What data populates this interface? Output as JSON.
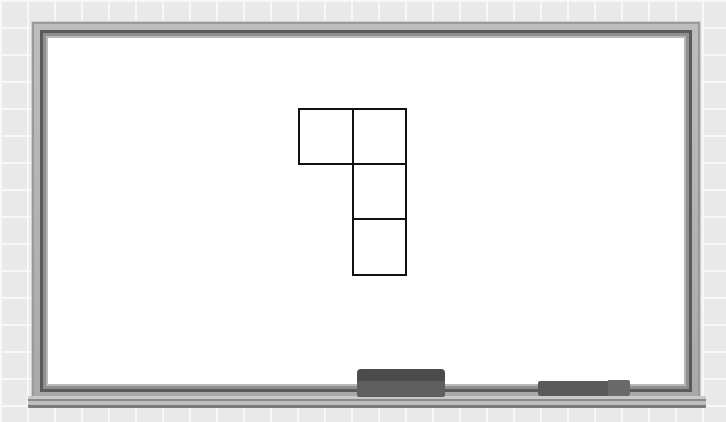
{
  "scene": {
    "background": "tiled-wall",
    "board": "whiteboard",
    "accessories": [
      "eraser",
      "marker"
    ]
  },
  "shape": {
    "description": "four unit squares: one square to the left of the top of a vertical column of three",
    "unit_squares": [
      {
        "col": 0,
        "row": 0
      },
      {
        "col": 1,
        "row": 0
      },
      {
        "col": 1,
        "row": 1
      },
      {
        "col": 1,
        "row": 2
      }
    ],
    "square_count": 4,
    "stroke_color": "#111111"
  }
}
